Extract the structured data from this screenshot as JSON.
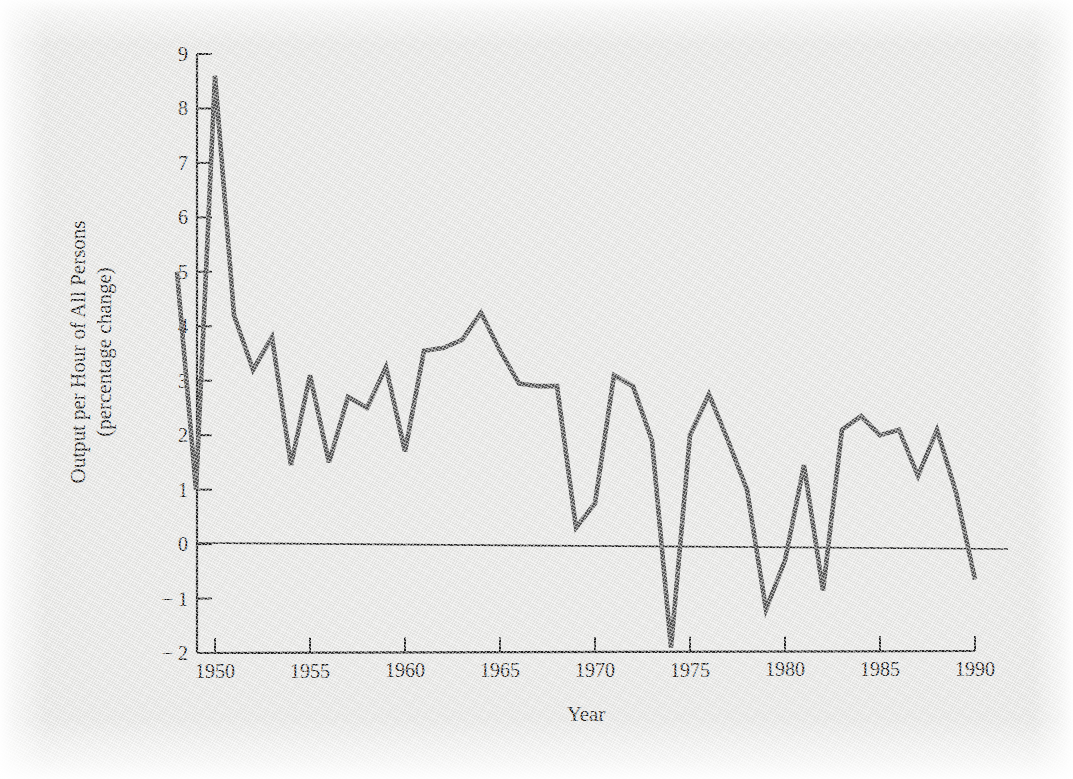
{
  "figure": {
    "background_color": "#e8e8e6",
    "line_color": "#4e4e4e",
    "axis_color": "#1c1c1c"
  },
  "chart_data": {
    "type": "line",
    "title": "",
    "xlabel": "Year",
    "ylabel": "Output per Hour of All Persons (percentage change)",
    "ylabel_line1": "Output per Hour of All Persons",
    "ylabel_line2": "(percentage change)",
    "xlim": [
      1948,
      1990
    ],
    "ylim": [
      -2,
      9
    ],
    "grid": false,
    "legend": "none",
    "y_ticks": [
      -2,
      -1,
      0,
      1,
      2,
      3,
      4,
      5,
      6,
      7,
      8,
      9
    ],
    "y_tick_labels": [
      "-2",
      "-1",
      "0",
      "1",
      "2",
      "3",
      "4",
      "5",
      "6",
      "7",
      "8",
      "9"
    ],
    "x_ticks": [
      1950,
      1955,
      1960,
      1965,
      1970,
      1975,
      1980,
      1985,
      1990
    ],
    "x_tick_labels": [
      "1950",
      "1955",
      "1960",
      "1965",
      "1970",
      "1975",
      "1980",
      "1985",
      "1990"
    ],
    "series": [
      {
        "name": "Output per hour of all persons",
        "x": [
          1948,
          1949,
          1950,
          1951,
          1952,
          1953,
          1954,
          1955,
          1956,
          1957,
          1958,
          1959,
          1960,
          1961,
          1962,
          1963,
          1964,
          1965,
          1966,
          1967,
          1968,
          1969,
          1970,
          1971,
          1972,
          1973,
          1974,
          1975,
          1976,
          1977,
          1978,
          1979,
          1980,
          1981,
          1982,
          1983,
          1984,
          1985,
          1986,
          1987,
          1988,
          1989,
          1990
        ],
        "values": [
          5.0,
          1.0,
          8.6,
          4.2,
          3.2,
          3.8,
          1.45,
          3.1,
          1.5,
          2.7,
          2.5,
          3.25,
          1.7,
          3.55,
          3.6,
          3.75,
          4.25,
          3.55,
          2.95,
          2.9,
          2.9,
          0.3,
          0.75,
          3.1,
          2.9,
          1.9,
          -1.9,
          2.0,
          2.75,
          1.9,
          1.0,
          -1.2,
          -0.3,
          1.45,
          -0.85,
          2.1,
          2.35,
          2.0,
          2.1,
          1.25,
          2.1,
          0.95,
          -0.65
        ]
      }
    ]
  },
  "plot_geometry": {
    "x_pixel_1950": 215,
    "x_pixel_1990": 975,
    "y_pixel_9": 54,
    "y_pixel_minus2": 653
  }
}
